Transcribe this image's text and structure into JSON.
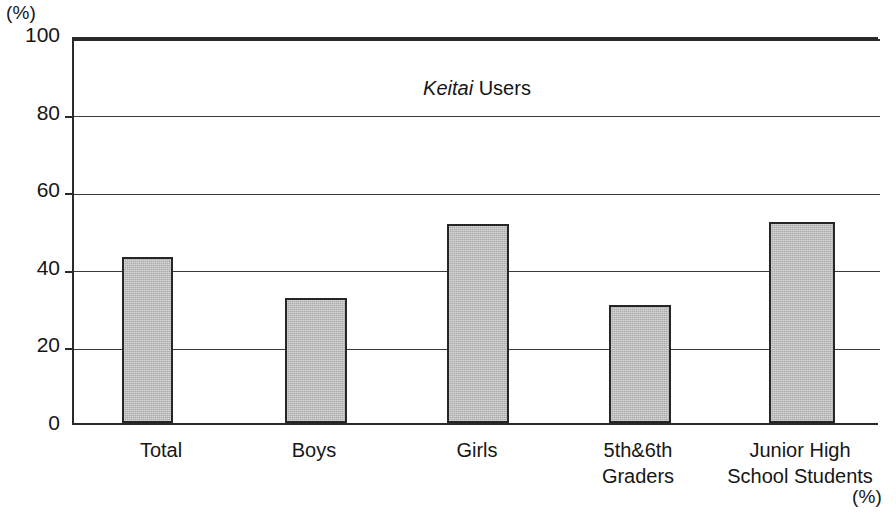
{
  "figure": {
    "unit_top_left": "(%)",
    "unit_bottom_right": "(%)"
  },
  "chart_data": {
    "type": "bar",
    "title": "Keitai Users",
    "title_italic_part": "Keitai",
    "title_roman_part": "Users",
    "xlabel": "",
    "ylabel": "(%)",
    "ylim": [
      0,
      100
    ],
    "yticks": [
      0,
      20,
      40,
      60,
      80,
      100
    ],
    "grid": true,
    "grid_axis": "y",
    "legend": false,
    "categories": [
      "Total",
      "Boys",
      "Girls",
      "5th&6th\nGraders",
      "Junior High\nSchool Students"
    ],
    "values": [
      42.7,
      32.3,
      51.4,
      30.5,
      51.7
    ],
    "value_labels": [
      "42.7",
      "32.3",
      "51.4",
      "30.5",
      "51.7"
    ],
    "bar_fill_color": "#adadad",
    "bar_edge_color": "#262626",
    "axis_color": "#2a2a2a",
    "background_color": "#ffffff"
  },
  "ytick_labels": [
    "100",
    "80",
    "60",
    "40",
    "20",
    "0"
  ]
}
